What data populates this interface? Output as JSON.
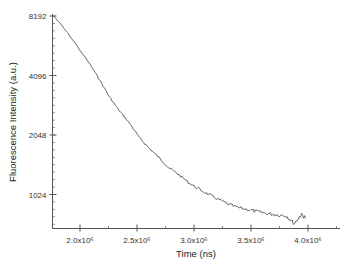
{
  "chart_data": {
    "type": "line",
    "title": "",
    "xlabel": "Time (ns)",
    "ylabel": "Fluorescence Intensity (a.u.)",
    "yscale": "log2",
    "xlim": [
      1760000.0,
      4280000.0
    ],
    "ylim": [
      512,
      8192
    ],
    "x_ticks": [
      2000000.0,
      2500000.0,
      3000000.0,
      3500000.0,
      4000000.0
    ],
    "x_tick_labels": [
      "2.0x10⁶",
      "2.5x10⁶",
      "3.0x10⁶",
      "3.5x10⁶",
      "4.0x10⁶"
    ],
    "y_ticks": [
      1024,
      2048,
      4096,
      8192
    ],
    "y_tick_labels": [
      "1024",
      "2048",
      "4096",
      "8192"
    ],
    "grid": false,
    "legend": null,
    "series": [
      {
        "name": "decay",
        "color": "#555555",
        "x": [
          1770000.0,
          1910000.0,
          2090000.0,
          2170000.0,
          2260000.0,
          2340000.0,
          2430000.0,
          2520000.0,
          2600000.0,
          2690000.0,
          2780000.0,
          2860000.0,
          2950000.0,
          3030000.0,
          3120000.0,
          3210000.0,
          3290000.0,
          3380000.0,
          3470000.0,
          3550000.0,
          3640000.0,
          3720000.0,
          3810000.0,
          3880000.0,
          3940000.0,
          3980000.0
        ],
        "y": [
          8192,
          6520,
          4640,
          3910,
          3180,
          2740,
          2370,
          1990,
          1770,
          1580,
          1400,
          1300,
          1180,
          1100,
          1030,
          970,
          920,
          880,
          860,
          840,
          820,
          810,
          800,
          730,
          810,
          780
        ]
      }
    ]
  },
  "axes": {
    "x_title": "Time (ns)",
    "y_title": "Fluorescence Intensity (a.u.)"
  }
}
